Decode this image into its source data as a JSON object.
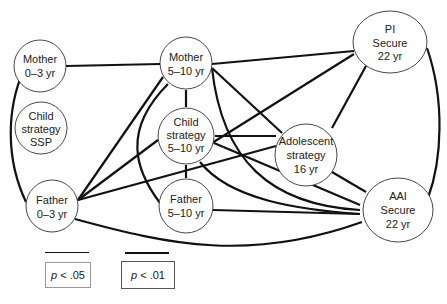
{
  "diagram": {
    "nodes": [
      {
        "id": "mother_0_3",
        "lines": [
          "Mother",
          "0–3 yr"
        ]
      },
      {
        "id": "child_ssp",
        "lines": [
          "Child",
          "strategy",
          "SSP"
        ]
      },
      {
        "id": "father_0_3",
        "lines": [
          "Father",
          "0–3 yr"
        ]
      },
      {
        "id": "mother_5_10",
        "lines": [
          "Mother",
          "5–10 yr"
        ]
      },
      {
        "id": "child_5_10",
        "lines": [
          "Child",
          "strategy",
          "5–10 yr"
        ]
      },
      {
        "id": "father_5_10",
        "lines": [
          "Father",
          "5–10 yr"
        ]
      },
      {
        "id": "pi_secure",
        "lines": [
          "PI",
          "Secure",
          "22 yr"
        ]
      },
      {
        "id": "adolescent",
        "lines": [
          "Adolescent",
          "strategy",
          "16 yr"
        ]
      },
      {
        "id": "aai_secure",
        "lines": [
          "AAI",
          "Secure",
          "22 yr"
        ]
      }
    ],
    "edges": [
      {
        "from": "mother_0_3",
        "to": "mother_5_10"
      },
      {
        "from": "mother_0_3",
        "to": "father_0_3"
      },
      {
        "from": "father_0_3",
        "to": "mother_5_10"
      },
      {
        "from": "father_0_3",
        "to": "child_5_10"
      },
      {
        "from": "father_0_3",
        "to": "adolescent"
      },
      {
        "from": "father_0_3",
        "to": "aai_secure"
      },
      {
        "from": "mother_5_10",
        "to": "child_5_10"
      },
      {
        "from": "mother_5_10",
        "to": "pi_secure"
      },
      {
        "from": "mother_5_10",
        "to": "adolescent"
      },
      {
        "from": "mother_5_10",
        "to": "father_5_10"
      },
      {
        "from": "mother_5_10",
        "to": "aai_secure"
      },
      {
        "from": "child_5_10",
        "to": "pi_secure"
      },
      {
        "from": "child_5_10",
        "to": "adolescent"
      },
      {
        "from": "child_5_10",
        "to": "aai_secure"
      },
      {
        "from": "child_5_10",
        "to": "father_5_10"
      },
      {
        "from": "father_5_10",
        "to": "aai_secure"
      },
      {
        "from": "adolescent",
        "to": "pi_secure"
      },
      {
        "from": "adolescent",
        "to": "aai_secure"
      },
      {
        "from": "pi_secure",
        "to": "aai_secure"
      }
    ]
  },
  "legend": {
    "thin": {
      "label_p": "p",
      "label_rest": " < .05"
    },
    "thick": {
      "label_p": "p",
      "label_rest": " < .01"
    }
  }
}
